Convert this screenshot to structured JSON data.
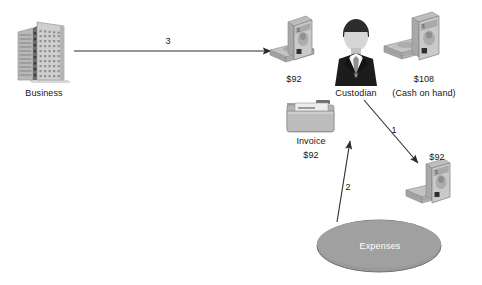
{
  "diagram": {
    "background_color": "#ffffff",
    "accent_gray": "#9a9a9a",
    "line_color": "#2b2b2b"
  },
  "nodes": {
    "business": {
      "label": "Business",
      "icon": "office-building-icon"
    },
    "custodian": {
      "label": "Custodian",
      "icon": "businessman-icon"
    },
    "cash_left": {
      "amount": "$92",
      "icon": "cash-stack-icon"
    },
    "cash_right": {
      "amount": "$108",
      "note": "(Cash on hand)",
      "icon": "cash-stack-icon"
    },
    "cash_bottom": {
      "amount": "$92",
      "icon": "cash-stack-icon"
    },
    "invoice": {
      "label": "Invoice",
      "amount": "$92",
      "icon": "invoice-folder-icon"
    },
    "expenses": {
      "label": "Expenses",
      "shape": "ellipse",
      "fill": "#9a9a9a"
    }
  },
  "arrows": [
    {
      "id": "arrow-3",
      "number": "3",
      "from": "business",
      "to": "custodian"
    },
    {
      "id": "arrow-1",
      "number": "1",
      "from": "custodian",
      "to": "cash_bottom"
    },
    {
      "id": "arrow-2",
      "number": "2",
      "from": "expenses",
      "to": "invoice"
    }
  ]
}
